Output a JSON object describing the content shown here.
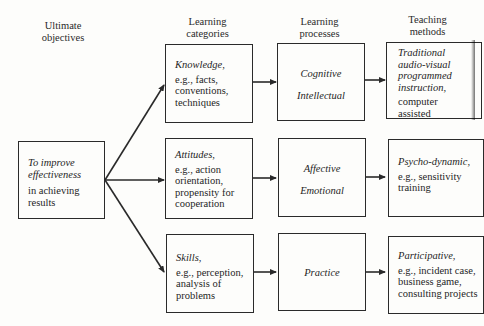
{
  "headers": {
    "objectives": [
      "Ultimate",
      "objectives"
    ],
    "categories": [
      "Learning",
      "categories"
    ],
    "processes": [
      "Learning",
      "processes"
    ],
    "methods": [
      "Teaching",
      "methods"
    ]
  },
  "objective": {
    "italic": [
      "To improve",
      "effectiveness"
    ],
    "normal": [
      "in achieving",
      "results"
    ]
  },
  "categories": [
    {
      "title": "Knowledge,",
      "lines": [
        "e.g., facts,",
        "conventions,",
        "techniques"
      ]
    },
    {
      "title": "Attitudes,",
      "lines": [
        "e.g., action",
        "orientation,",
        "propensity for",
        "cooperation"
      ]
    },
    {
      "title": "Skills,",
      "lines": [
        "e.g., perception,",
        "analysis of",
        "problems"
      ]
    }
  ],
  "processes": [
    {
      "lines": [
        "Cognitive",
        "Intellectual"
      ]
    },
    {
      "lines": [
        "Affective",
        "Emotional"
      ]
    },
    {
      "lines": [
        "Practice"
      ]
    }
  ],
  "methods": [
    {
      "italic": [
        "Traditional",
        "audio-visual",
        "programmed",
        "instruction,"
      ],
      "normal": [
        "computer",
        "assisted"
      ]
    },
    {
      "italic": [
        "Psycho-dynamic,"
      ],
      "normal": [
        "e.g., sensitivity",
        "training"
      ]
    },
    {
      "italic": [
        "Participative,"
      ],
      "normal": [
        "e.g., incident case,",
        "business game,",
        "consulting projects"
      ]
    }
  ],
  "colors": {
    "ink": "#2a2a2a",
    "paper": "#fdfdfb"
  }
}
